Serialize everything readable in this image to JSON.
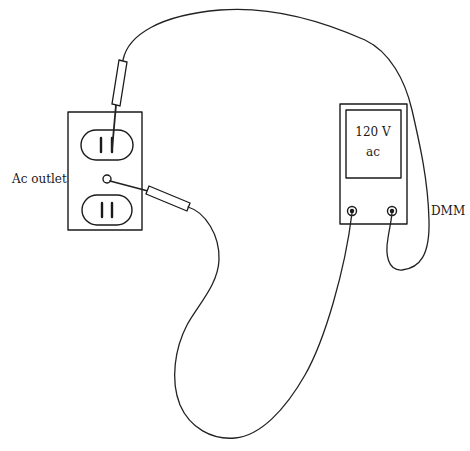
{
  "diagram": {
    "type": "measurement-setup",
    "labels": {
      "outlet": "Ac outlet",
      "meter": "DMM",
      "display_line1": "120 V",
      "display_line2": "ac"
    },
    "components": [
      {
        "id": "ac-outlet",
        "kind": "duplex receptacle",
        "receptacles": 2,
        "has_center_screw": true
      },
      {
        "id": "dmm",
        "kind": "digital multimeter",
        "jacks": 2,
        "reading": "120 V ac"
      },
      {
        "id": "probe-1",
        "kind": "test probe",
        "connects": [
          "ac-outlet top receptacle slot",
          "dmm right jack"
        ]
      },
      {
        "id": "probe-2",
        "kind": "test probe",
        "connects": [
          "ac-outlet center screw",
          "dmm left jack"
        ]
      }
    ],
    "colors": {
      "line": "#1a1a1a",
      "background": "#ffffff"
    }
  }
}
